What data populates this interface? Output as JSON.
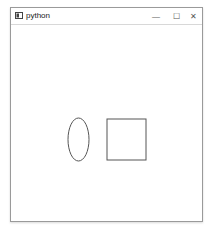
{
  "window": {
    "title": "python",
    "controls": {
      "minimize": "—",
      "maximize": "☐",
      "close": "✕"
    }
  },
  "canvas": {
    "shapes": [
      {
        "type": "ellipse",
        "cx": 67.5,
        "cy": 115.5,
        "rx": 10.5,
        "ry": 21.5,
        "stroke": "#555555"
      },
      {
        "type": "rectangle",
        "x": 96,
        "y": 95,
        "width": 39,
        "height": 41,
        "stroke": "#555555"
      }
    ]
  }
}
